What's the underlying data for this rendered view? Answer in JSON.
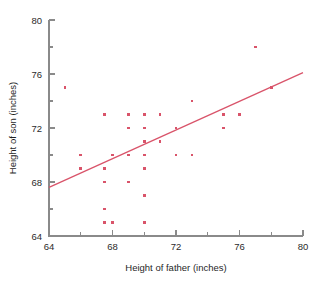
{
  "chart_data": {
    "type": "scatter",
    "title": "",
    "xlabel": "Height of father (inches)",
    "ylabel": "Height of son (inches)",
    "xlim": [
      64,
      80
    ],
    "ylim": [
      64,
      80
    ],
    "grid": false,
    "legend": null,
    "x_ticks_major": [
      64,
      68,
      72,
      76,
      80
    ],
    "x_ticks_minor": [
      66,
      70,
      74,
      78
    ],
    "y_ticks_major": [
      64,
      68,
      72,
      76,
      80
    ],
    "y_ticks_minor": [
      66,
      70,
      74,
      78
    ],
    "x_tick_labels": [
      "64",
      "68",
      "72",
      "76",
      "80"
    ],
    "y_tick_labels": [
      "64",
      "68",
      "72",
      "76",
      "80"
    ],
    "marker_color": "#d9546a",
    "line_color": "#d9546a",
    "axis_color": "#8a8a8a",
    "series": [
      {
        "name": "father-son heights",
        "points": [
          [
            65.0,
            75.0
          ],
          [
            66.0,
            70.0
          ],
          [
            66.0,
            69.0
          ],
          [
            67.5,
            73.0
          ],
          [
            67.5,
            69.0
          ],
          [
            67.5,
            68.0
          ],
          [
            67.5,
            66.0
          ],
          [
            67.5,
            65.0
          ],
          [
            68.0,
            70.0
          ],
          [
            68.0,
            65.0
          ],
          [
            69.0,
            73.0
          ],
          [
            69.0,
            72.0
          ],
          [
            69.0,
            70.0
          ],
          [
            69.0,
            68.0
          ],
          [
            70.0,
            73.0
          ],
          [
            70.0,
            72.0
          ],
          [
            70.0,
            71.0
          ],
          [
            70.0,
            70.0
          ],
          [
            70.0,
            69.0
          ],
          [
            70.0,
            67.0
          ],
          [
            70.0,
            65.0
          ],
          [
            71.0,
            73.0
          ],
          [
            71.0,
            71.0
          ],
          [
            72.0,
            72.0
          ],
          [
            72.0,
            70.0
          ],
          [
            73.0,
            74.0
          ],
          [
            73.0,
            70.0
          ],
          [
            75.0,
            73.0
          ],
          [
            75.0,
            72.0
          ],
          [
            76.0,
            73.0
          ],
          [
            77.0,
            78.0
          ],
          [
            78.0,
            75.0
          ]
        ]
      }
    ],
    "fit_line": {
      "name": "regression-line",
      "x_start": 64,
      "y_start": 67.6,
      "x_end": 80,
      "y_end": 76.1
    }
  }
}
